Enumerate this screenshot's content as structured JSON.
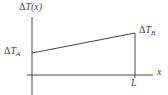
{
  "figure": {
    "y_axis_label": {
      "delta": "Δ",
      "main": "T(x)"
    },
    "point_a_label": {
      "delta": "Δ",
      "main": "T",
      "sub": "A"
    },
    "point_b_label": {
      "delta": "Δ",
      "main": "T",
      "sub": "B"
    },
    "x_axis_label": "x",
    "length_label": "L",
    "line_color": "#4a4a4a",
    "text_color": "#3d3d3d",
    "background_color": "#ffffff"
  }
}
